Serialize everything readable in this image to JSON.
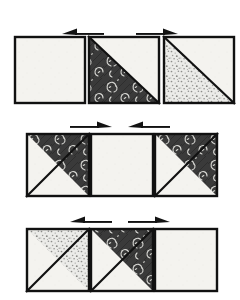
{
  "diagram": {
    "background_color": "#ffffff",
    "canvas": {
      "width": 240,
      "height": 300
    },
    "fabrics": {
      "light": {
        "name": "light-cream-solid",
        "label": "Light",
        "color": "#f4f3ef",
        "texture": "plain"
      },
      "dark_floral": {
        "name": "dark-charcoal-floral",
        "label": "Dark Floral",
        "color": "#3a3a3a",
        "motif_color": "#d8d8d4",
        "texture": "floral-vine"
      },
      "gray_speckle": {
        "name": "gray-speckled",
        "label": "Gray Speckle",
        "color": "#ebebe8",
        "motif_color": "#8a8a88",
        "texture": "speckle"
      }
    },
    "outline_color": "#111111",
    "arrow_color": "#121212",
    "rows": [
      {
        "id": "row-1",
        "label": "Row 1",
        "y": 36,
        "height": 68,
        "arrow_y": 30,
        "arrows": [
          {
            "id": "row-1-arrow-left",
            "direction": "left",
            "label": "press left",
            "x": 62,
            "width": 42
          },
          {
            "id": "row-1-arrow-right",
            "direction": "right",
            "label": "press right",
            "x": 136,
            "width": 42
          }
        ],
        "units": [
          {
            "id": "row-1-unit-1",
            "label": "Unit 1",
            "x": 14,
            "width": 72,
            "pattern": "solid",
            "fill": "light",
            "triangle": null
          },
          {
            "id": "row-1-unit-2",
            "label": "Unit 2",
            "x": 88,
            "width": 72,
            "pattern": "half-square-triangle",
            "fill": "light",
            "triangle": {
              "fabric": "dark_floral",
              "corner": "bottom-left"
            }
          },
          {
            "id": "row-1-unit-3",
            "label": "Unit 3",
            "x": 163,
            "width": 72,
            "pattern": "half-square-triangle",
            "fill": "light",
            "triangle": {
              "fabric": "gray_speckle",
              "corner": "bottom-left"
            }
          }
        ]
      },
      {
        "id": "row-2",
        "label": "Row 2",
        "y": 133,
        "height": 64,
        "arrow_y": 123,
        "arrows": [
          {
            "id": "row-2-arrow-left",
            "direction": "right",
            "label": "press right",
            "x": 70,
            "width": 42
          },
          {
            "id": "row-2-arrow-right",
            "direction": "left",
            "label": "press left",
            "x": 128,
            "width": 42
          }
        ],
        "units": [
          {
            "id": "row-2-unit-1",
            "label": "Unit 1",
            "x": 26,
            "width": 64,
            "pattern": "half-square-triangle",
            "fill": "light",
            "triangle": {
              "fabric": "dark_floral",
              "corner": "top-right"
            }
          },
          {
            "id": "row-2-unit-2",
            "label": "Unit 2",
            "x": 90,
            "width": 64,
            "pattern": "solid",
            "fill": "light",
            "triangle": null
          },
          {
            "id": "row-2-unit-3",
            "label": "Unit 3",
            "x": 154,
            "width": 64,
            "pattern": "half-square-triangle",
            "fill": "light",
            "triangle": {
              "fabric": "dark_floral",
              "corner": "top-right"
            }
          }
        ]
      },
      {
        "id": "row-3",
        "label": "Row 3",
        "y": 228,
        "height": 64,
        "arrow_y": 218,
        "arrows": [
          {
            "id": "row-3-arrow-left",
            "direction": "left",
            "label": "press left",
            "x": 70,
            "width": 42
          },
          {
            "id": "row-3-arrow-right",
            "direction": "right",
            "label": "press right",
            "x": 128,
            "width": 42
          }
        ],
        "units": [
          {
            "id": "row-3-unit-1",
            "label": "Unit 1",
            "x": 26,
            "width": 64,
            "pattern": "half-square-triangle",
            "fill": "light",
            "triangle": {
              "fabric": "gray_speckle",
              "corner": "top-right"
            }
          },
          {
            "id": "row-3-unit-2",
            "label": "Unit 2",
            "x": 90,
            "width": 64,
            "pattern": "half-square-triangle",
            "fill": "light",
            "triangle": {
              "fabric": "dark_floral",
              "corner": "top-right"
            }
          },
          {
            "id": "row-3-unit-3",
            "label": "Unit 3",
            "x": 154,
            "width": 64,
            "pattern": "solid",
            "fill": "light",
            "triangle": null
          }
        ]
      }
    ]
  }
}
